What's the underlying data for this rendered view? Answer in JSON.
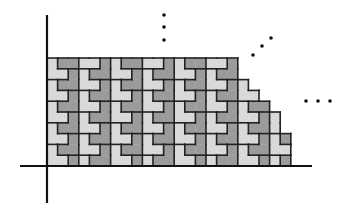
{
  "figure": {
    "colors": {
      "background": "#ffffff",
      "light_tile": "#d9d9d9",
      "dark_tile": "#9b9b9b",
      "outline": "#222222",
      "axis": "#111111"
    },
    "axes": {
      "origin": [
        47,
        166
      ],
      "x_axis": {
        "from": 20,
        "to": 312
      },
      "y_axis": {
        "from": 15,
        "to": 203
      }
    },
    "grid": {
      "unit_w": 10.6,
      "unit_h": 10.8,
      "columns": 23,
      "column_heights_units": [
        10,
        10,
        10,
        10,
        10,
        10,
        10,
        10,
        10,
        10,
        10,
        10,
        10,
        10,
        10,
        10,
        10,
        10,
        8,
        7,
        6,
        5,
        3
      ]
    },
    "ellipses": {
      "vertical": [
        [
          164,
          15
        ],
        [
          164,
          27
        ],
        [
          164,
          40
        ]
      ],
      "diagonal": [
        [
          253,
          55
        ],
        [
          262,
          46
        ],
        [
          271,
          38
        ]
      ],
      "horizontal": [
        [
          306,
          101
        ],
        [
          318,
          101
        ],
        [
          330,
          101
        ]
      ]
    }
  }
}
